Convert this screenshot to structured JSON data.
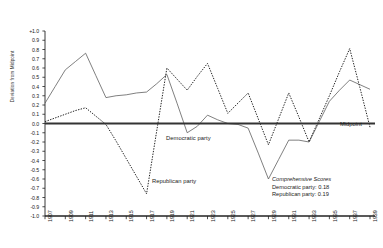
{
  "chart_data": {
    "type": "line",
    "title": "",
    "subtitle": "",
    "xlabel": "",
    "ylabel": "Deviation from Midpoint",
    "xlim": [
      1907,
      1939
    ],
    "ylim": [
      -1.0,
      1.0
    ],
    "grid": false,
    "legend_position": "inline-annotations",
    "y_ticks": [
      "+1.0",
      "0.9",
      "0.8",
      "0.7",
      "0.6",
      "0.5",
      "0.4",
      "0.3",
      "0.2",
      "0.1",
      "0.0",
      "-0.1",
      "-0.2",
      "-0.3",
      "-0.4",
      "-0.5",
      "-0.6",
      "-0.7",
      "-0.8",
      "-0.9",
      "-1.0"
    ],
    "y_tick_values": [
      1.0,
      0.9,
      0.8,
      0.7,
      0.6,
      0.5,
      0.4,
      0.3,
      0.2,
      0.1,
      0.0,
      -0.1,
      -0.2,
      -0.3,
      -0.4,
      -0.5,
      -0.6,
      -0.7,
      -0.8,
      -0.9,
      -1.0
    ],
    "x_ticks": [
      "1907",
      "1909",
      "1911",
      "1913",
      "1915",
      "1917",
      "1919",
      "1921",
      "1923",
      "1925",
      "1927",
      "1929",
      "1931",
      "1933",
      "1935",
      "1937",
      "1939"
    ],
    "x_tick_values": [
      1907,
      1909,
      1911,
      1913,
      1915,
      1917,
      1919,
      1921,
      1923,
      1925,
      1927,
      1929,
      1931,
      1933,
      1935,
      1937,
      1939
    ],
    "x": [
      1907,
      1908,
      1909,
      1910,
      1911,
      1912,
      1913,
      1914,
      1915,
      1916,
      1917,
      1918,
      1919,
      1920,
      1921,
      1922,
      1923,
      1924,
      1925,
      1926,
      1927,
      1928,
      1929,
      1930,
      1931,
      1932,
      1933,
      1934,
      1935,
      1936,
      1937,
      1938,
      1939
    ],
    "series": [
      {
        "name": "Democratic party",
        "style": "solid",
        "color": "#555555",
        "values": [
          0.22,
          0.4,
          0.58,
          0.67,
          0.76,
          0.52,
          0.28,
          0.3,
          0.31,
          0.33,
          0.34,
          0.43,
          0.53,
          0.22,
          -0.1,
          -0.03,
          0.09,
          0.04,
          0.0,
          -0.01,
          -0.05,
          -0.32,
          -0.6,
          -0.39,
          -0.18,
          -0.18,
          -0.2,
          0.02,
          0.24,
          0.36,
          0.47,
          0.42,
          0.37
        ]
      },
      {
        "name": "Republican party",
        "style": "dotted",
        "color": "#222222",
        "values": [
          0.02,
          0.06,
          0.1,
          0.14,
          0.17,
          0.08,
          -0.01,
          -0.19,
          -0.38,
          -0.57,
          -0.76,
          -0.08,
          0.6,
          0.48,
          0.36,
          0.51,
          0.65,
          0.38,
          0.11,
          0.22,
          0.33,
          0.05,
          -0.23,
          0.05,
          0.33,
          0.07,
          -0.2,
          0.05,
          0.3,
          0.56,
          0.81,
          0.39,
          -0.04
        ]
      }
    ],
    "midpoint_line": {
      "label": "Midpoint",
      "value": 0.0,
      "color": "#333333"
    },
    "annotations": {
      "democratic_label": "Democratic party",
      "republican_label": "Republican party",
      "scores_title": "Comprehensive Scores",
      "scores_democratic": "Democratic party: 0.18",
      "scores_republican": "Republican party: 0.19"
    }
  }
}
